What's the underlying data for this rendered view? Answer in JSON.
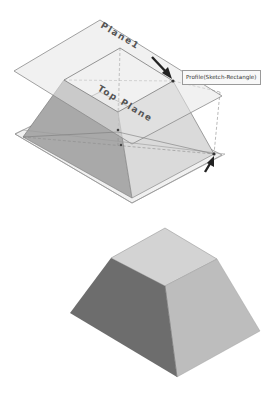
{
  "figure": {
    "top_view": {
      "description": "Loft preview between two sketch profiles on parallel planes",
      "planes": [
        {
          "label": "Plane1"
        },
        {
          "label": "Top Plane"
        }
      ],
      "tooltip": "Profile(Sketch-Rectangle)",
      "arrows": [
        "upper-profile-pointer",
        "lower-profile-pointer"
      ]
    },
    "bottom_view": {
      "description": "Resulting lofted solid (frustum)"
    },
    "colors": {
      "plane_fill": "#ececec",
      "plane_edge": "#8a8a8a",
      "face_dark": "#6e6e6e",
      "face_mid": "#b8b8b8",
      "face_light": "#d6d6d6",
      "arrow": "#222222"
    }
  }
}
